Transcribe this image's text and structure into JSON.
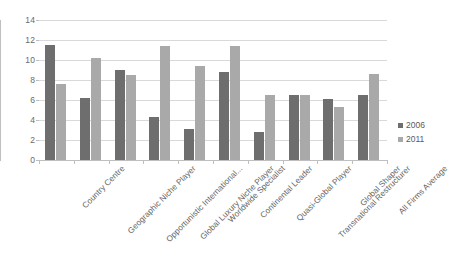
{
  "chart_data": {
    "type": "bar",
    "title": "",
    "subtitle": "",
    "xlabel": "",
    "ylabel": "",
    "ylim": [
      0,
      14
    ],
    "ytick_step": 2,
    "ytick_labels": [
      "0",
      "2",
      "4",
      "6",
      "8",
      "10",
      "12",
      "14"
    ],
    "grid": true,
    "legend_position": "right",
    "categories": [
      "Country Centre",
      "Geographic Niche Player",
      "Opportunistic International...",
      "Global Luxury Niche Player",
      "Worldwide Specialist",
      "Continental Leader",
      "Quasi-Global Player",
      "Transnational Restructurer",
      "Global Shaper",
      "All Firms Average"
    ],
    "series": [
      {
        "name": "2006",
        "color": "#6e6e6e",
        "values": [
          11.5,
          6.2,
          9.0,
          4.3,
          3.1,
          8.8,
          2.8,
          6.5,
          6.1,
          6.5
        ]
      },
      {
        "name": "2011",
        "color": "#a9a9a9",
        "values": [
          7.6,
          10.2,
          8.5,
          11.4,
          9.4,
          11.4,
          6.5,
          6.5,
          5.3,
          8.6
        ]
      }
    ]
  },
  "legend": {
    "items": [
      {
        "label": "2006",
        "color": "#6e6e6e"
      },
      {
        "label": "2011",
        "color": "#a9a9a9"
      }
    ]
  },
  "colors": {
    "series_2006": "#6e6e6e",
    "series_2011": "#a9a9a9",
    "gridline": "#d9d9d9",
    "axis": "#bfbfbf",
    "text": "#646464",
    "background": "#ffffff"
  }
}
